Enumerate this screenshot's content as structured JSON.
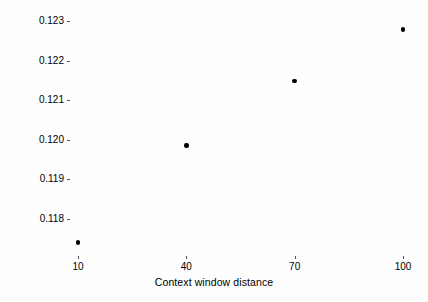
{
  "chart_data": {
    "type": "scatter",
    "title": "",
    "xlabel": "Context window distance",
    "ylabel": "Mean local clustering coefficient",
    "x": [
      10,
      40,
      70,
      100
    ],
    "values": [
      0.11741,
      0.11986,
      0.12148,
      0.12278
    ],
    "xticks": [
      "10",
      "40",
      "70",
      "100"
    ],
    "xtick_values": [
      10,
      40,
      70,
      100
    ],
    "yticks": [
      "0.118",
      "0.119",
      "0.120",
      "0.121",
      "0.122",
      "0.123"
    ],
    "ytick_values": [
      0.118,
      0.119,
      0.12,
      0.121,
      0.122,
      0.123
    ],
    "xlim": [
      10,
      100
    ],
    "ylim": [
      0.1174,
      0.1233
    ],
    "grid": false,
    "legend": false,
    "marker_color": "#000000",
    "background_color": "#ffffff",
    "points": [
      {
        "x": 10,
        "y": 0.11741
      },
      {
        "x": 40,
        "y": 0.11986
      },
      {
        "x": 70,
        "y": 0.12148
      },
      {
        "x": 100,
        "y": 0.12278
      }
    ]
  }
}
